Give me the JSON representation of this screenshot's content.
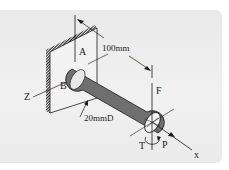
{
  "diagram": {
    "type": "mechanics-free-body",
    "labels": {
      "point_a": "A",
      "point_b": "B",
      "force_f": "F",
      "torque_t": "T",
      "axial_p": "P",
      "axis_x": "x",
      "axis_z": "Z",
      "length_dim": "100mm",
      "diameter_dim": "20mmD"
    },
    "colors": {
      "panel_bg": "#eeeeee",
      "line": "#1a1a1a",
      "shaft_light": "#f4f4f4",
      "shaft_dark": "#7a7a7a"
    }
  }
}
